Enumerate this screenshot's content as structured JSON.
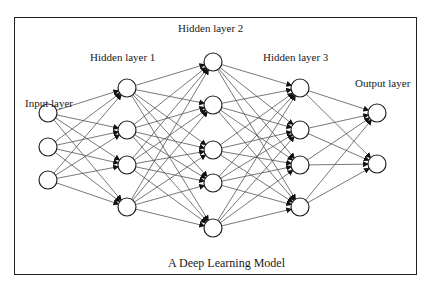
{
  "diagram": {
    "caption": "A Deep Learning Model",
    "colors": {
      "edge": "#555555",
      "node_stroke": "#222222",
      "node_fill": "#ffffff",
      "frame": "#222222",
      "arrowhead": "#111111"
    },
    "layers": [
      {
        "name": "Input layer",
        "label_pos": [
          25,
          97
        ],
        "x": 48,
        "nodes_y": [
          113,
          147,
          180
        ]
      },
      {
        "name": "Hidden layer 1",
        "label_pos": [
          90,
          51
        ],
        "x": 127,
        "nodes_y": [
          88,
          130,
          165,
          207
        ]
      },
      {
        "name": "Hidden layer 2",
        "label_pos": [
          178,
          22
        ],
        "x": 213,
        "nodes_y": [
          62,
          105,
          150,
          183,
          228
        ]
      },
      {
        "name": "Hidden layer 3",
        "label_pos": [
          263,
          51
        ],
        "x": 300,
        "nodes_y": [
          88,
          130,
          165,
          207
        ]
      },
      {
        "name": "Output layer",
        "label_pos": [
          355,
          77
        ],
        "x": 377,
        "nodes_y": [
          113,
          164
        ]
      }
    ],
    "node_radius": 9,
    "connectivity": "fully-connected"
  }
}
